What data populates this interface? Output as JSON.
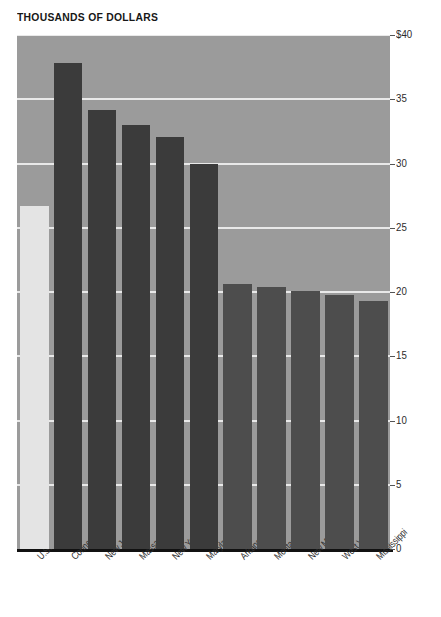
{
  "chart_data": {
    "type": "bar",
    "title": "THOUSANDS OF DOLLARS",
    "subtitle": "",
    "xlabel": "",
    "ylabel": "",
    "ylim": [
      0,
      40
    ],
    "grid": true,
    "legend": "none",
    "y_ticks": [
      "0",
      "5",
      "10",
      "15",
      "20",
      "25",
      "30",
      "35",
      "$40"
    ],
    "y_tick_values": [
      0,
      5,
      10,
      15,
      20,
      25,
      30,
      35,
      40
    ],
    "categories": [
      "U.S.",
      "Connecticut",
      "New Jersey",
      "Massachusetts",
      "New York",
      "Maryland",
      "Arkansas",
      "Montana",
      "New Mexico",
      "West Virginia",
      "Mississippi"
    ],
    "values": [
      26.7,
      37.8,
      34.2,
      33.0,
      32.1,
      30.0,
      20.6,
      20.4,
      20.1,
      19.8,
      19.3
    ],
    "bar_groups": [
      "us",
      "hi",
      "hi",
      "hi",
      "hi",
      "hi",
      "lo",
      "lo",
      "lo",
      "lo",
      "lo"
    ]
  },
  "colors": {
    "plot_background": "#9b9b9b",
    "gridline": "#e9e9e9",
    "bar_us": "#e4e4e4",
    "bar_high": "#3b3b3b",
    "bar_low": "#4d4d4d",
    "axis": "#111111",
    "text": "#2b2b2b",
    "page_background": "#ffffff"
  }
}
